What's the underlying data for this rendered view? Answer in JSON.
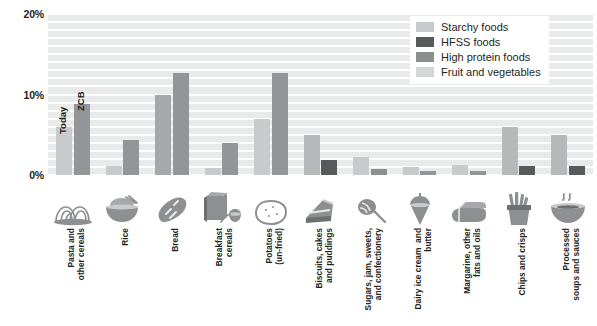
{
  "chart_data": {
    "type": "bar",
    "title": "",
    "subtitle": "",
    "xlabel": "",
    "ylabel": "",
    "ylim": [
      0,
      20
    ],
    "yticks": [
      0,
      10,
      20
    ],
    "ytick_labels": [
      "0%",
      "10%",
      "20%"
    ],
    "grid": true,
    "grid_interval": 1,
    "legend_position": "top-right",
    "categories": [
      "Pasta and\nother cereals",
      "Rice",
      "Bread",
      "Breakfast\ncereals",
      "Potatoes\n(un-fried)",
      "Biscuits, cakes\nand puddings",
      "Sugars, jam, sweets,\nand confectionery",
      "Dairy ice cream  and\nbutter",
      "Margarine, other\nfats and oils",
      "Chips and crisps",
      "Processed\nsoups and sauces"
    ],
    "category_icons": [
      "pasta-icon",
      "rice-bowl-icon",
      "bread-icon",
      "cereal-box-icon",
      "potato-icon",
      "cake-slice-icon",
      "lollipop-icon",
      "ice-cream-cone-icon",
      "butter-block-icon",
      "fries-icon",
      "soup-bowl-icon"
    ],
    "bar_annotations": [
      {
        "text": "Today",
        "category_index": 0,
        "series": "Today"
      },
      {
        "text": "ZCB",
        "category_index": 0,
        "series": "ZCB"
      }
    ],
    "series": [
      {
        "name": "Today",
        "values": [
          6.0,
          1.1,
          10.0,
          0.9,
          7.0,
          5.0,
          2.2,
          1.0,
          1.3,
          6.0,
          5.0
        ]
      },
      {
        "name": "ZCB",
        "values": [
          8.8,
          4.3,
          12.7,
          4.0,
          12.7,
          1.9,
          0.7,
          0.5,
          0.5,
          1.1,
          1.1
        ]
      }
    ],
    "series_colors": {
      "Today": [
        "#c9cacb",
        "#c9cacb",
        "#a6a8ab",
        "#c9cacb",
        "#c9cacb",
        "#b6b8ba",
        "#c9cacb",
        "#c9cacb",
        "#c9cacb",
        "#b6b8ba",
        "#b6b8ba"
      ],
      "ZCB": [
        "#939598",
        "#939598",
        "#939598",
        "#939598",
        "#939598",
        "#58595b",
        "#8d8f91",
        "#939598",
        "#939598",
        "#58595b",
        "#58595b"
      ]
    },
    "plot_background": "#e9eaea",
    "gridline_color": "#ffffff"
  },
  "legend": {
    "items": [
      {
        "label": "Starchy foods",
        "color": "#c9cacb",
        "swatch": "legend-swatch-starchy"
      },
      {
        "label": "HFSS foods",
        "color": "#58595b",
        "swatch": "legend-swatch-hfss"
      },
      {
        "label": "High protein foods",
        "color": "#8d8f91",
        "swatch": "legend-swatch-protein"
      },
      {
        "label": "Fruit and vegetables",
        "color": "#d5d6d7",
        "swatch": "legend-swatch-fruit"
      }
    ]
  }
}
